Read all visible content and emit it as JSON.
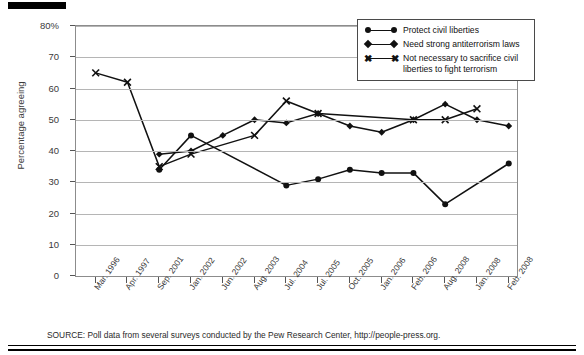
{
  "chart_data": {
    "type": "line",
    "title": "",
    "subtitle": "",
    "xlabel": "",
    "ylabel": "Percentage agreeing",
    "ylim": [
      0,
      80
    ],
    "yticks": [
      0,
      10,
      20,
      30,
      40,
      50,
      60,
      70,
      80
    ],
    "ytick_labels": [
      "0",
      "10",
      "20",
      "30",
      "40",
      "50",
      "60",
      "70",
      "80%"
    ],
    "grid": true,
    "legend_position": "top-right",
    "categories": [
      "Mar. 1996",
      "Apr. 1997",
      "Sep. 2001",
      "Jan. 2002",
      "Jun. 2002",
      "Aug. 2003",
      "Jul. 2004",
      "Jul. 2005",
      "Oct. 2005",
      "Jan. 2006",
      "Feb. 2006",
      "Aug. 2008",
      "Jan. 2008",
      "Feb. 2008"
    ],
    "series": [
      {
        "name": "Protect civil liberties",
        "marker": "circle",
        "values": [
          null,
          null,
          34,
          45,
          null,
          null,
          29,
          31,
          34,
          33,
          33,
          23,
          null,
          36
        ]
      },
      {
        "name": "Need strong antiterrorism laws",
        "marker": "diamond",
        "values": [
          null,
          null,
          39,
          40,
          45,
          50,
          49,
          52,
          48,
          46,
          50,
          55,
          50,
          48
        ]
      },
      {
        "name": "Not necessary to sacrifice civil liberties to fight terrorism",
        "marker": "x",
        "values": [
          65,
          62,
          35,
          39,
          null,
          45,
          56,
          52,
          null,
          null,
          50,
          50,
          53.5,
          null
        ]
      }
    ],
    "source": "SOURCE: Poll data from several surveys conducted by the Pew Research Center, http://people-press.org.",
    "colors": {
      "line": "#111111",
      "grid": "#b5b5b5",
      "frame": "#8c8c8c",
      "text": "#1a1a1a"
    }
  },
  "legend": {
    "items": [
      {
        "label": "Protect civil liberties",
        "marker": "circle-line-marker"
      },
      {
        "label": "Need strong antiterrorism laws",
        "marker": "diamond-line-marker"
      },
      {
        "label": "Not necessary to sacrifice civil liberties to fight terrorism",
        "marker": "x-line-marker"
      }
    ]
  }
}
